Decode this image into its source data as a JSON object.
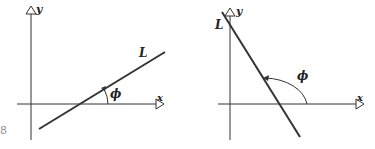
{
  "figures": [
    {
      "id": "left",
      "description": "Line L with positive slope; inclination angle phi acute",
      "axis_x_label": "x",
      "axis_y_label": "y",
      "line_label": "L",
      "angle_label": "ϕ"
    },
    {
      "id": "right",
      "description": "Line L with negative slope; inclination angle phi obtuse",
      "axis_x_label": "x",
      "axis_y_label": "y",
      "line_label": "L",
      "angle_label": "ϕ"
    }
  ],
  "edge_fragment": "8",
  "colors": {
    "ink": "#2a2a2a",
    "background": "#ffffff"
  }
}
